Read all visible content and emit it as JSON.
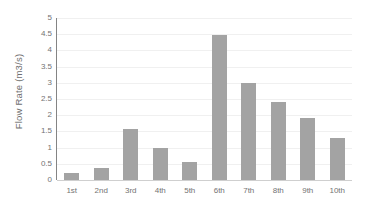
{
  "chart_data": {
    "type": "bar",
    "title": "",
    "subtitle": "",
    "xlabel": "",
    "ylabel": "Flow Rate (m3/s)",
    "categories": [
      "1st",
      "2nd",
      "3rd",
      "4th",
      "5th",
      "6th",
      "7th",
      "8th",
      "9th",
      "10th"
    ],
    "values": [
      0.22,
      0.37,
      1.57,
      0.98,
      0.56,
      4.49,
      3.0,
      2.4,
      1.92,
      1.3
    ],
    "ylim": [
      0,
      5
    ],
    "ytick_labels": [
      "0",
      "0.5",
      "1",
      "1.5",
      "2",
      "2.5",
      "3",
      "3.5",
      "4",
      "4.5",
      "5"
    ],
    "ytick_values": [
      0,
      0.5,
      1,
      1.5,
      2,
      2.5,
      3,
      3.5,
      4,
      4.5,
      5
    ],
    "grid": true,
    "grid_axis": "y",
    "legend": false,
    "legend_position": "none",
    "bar_color": "#a3a3a3",
    "gridline_color": "#f0f0f0",
    "axis_color": "#848484",
    "baseline_color": "#cfcfcf",
    "tick_label_color": "#737373",
    "axis_title_color": "#6e6e6e",
    "background_color": "#ffffff"
  }
}
